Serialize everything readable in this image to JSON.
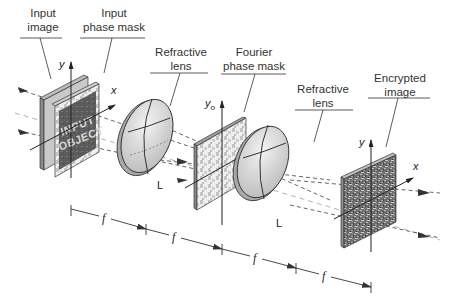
{
  "labels": {
    "input_image": [
      "Input",
      "image"
    ],
    "input_phase_mask": [
      "Input",
      "phase mask"
    ],
    "refractive_lens_1": [
      "Refractive",
      "lens"
    ],
    "fourier_phase_mask": [
      "Fourier",
      "phase mask"
    ],
    "refractive_lens_2": [
      "Refractive",
      "lens"
    ],
    "encrypted_image": [
      "Encrypted",
      "image"
    ]
  },
  "object_text": [
    "INPUT",
    "OBJECT"
  ],
  "axes": {
    "input": {
      "x": "x",
      "y": "y"
    },
    "fourier": {
      "x": "x",
      "y": "y",
      "subscript": "o"
    },
    "output": {
      "x": "x",
      "y": "y"
    }
  },
  "lens_labels": [
    "L",
    "L"
  ],
  "dimensions": [
    "f",
    "f",
    "f",
    "f"
  ],
  "colors": {
    "background": "#ffffff",
    "line": "#333333",
    "lens_fill": "#d9d9d9",
    "plate_dark": "#5a5a5a",
    "mask_light": "#e6e6e6"
  }
}
